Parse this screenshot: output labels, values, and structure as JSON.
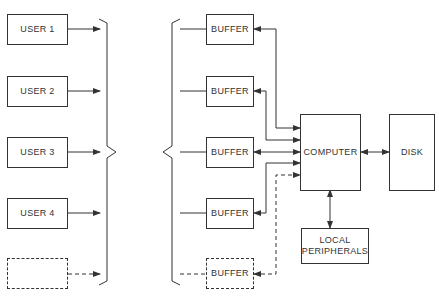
{
  "diagram": {
    "users": [
      {
        "label": "USER 1",
        "dashed": false
      },
      {
        "label": "USER 2",
        "dashed": false
      },
      {
        "label": "USER 3",
        "dashed": false
      },
      {
        "label": "USER 4",
        "dashed": false
      },
      {
        "label": "",
        "dashed": true
      }
    ],
    "buffers": [
      {
        "label": "BUFFER",
        "dashed": false
      },
      {
        "label": "BUFFER",
        "dashed": false
      },
      {
        "label": "BUFFER",
        "dashed": false
      },
      {
        "label": "BUFFER",
        "dashed": false
      },
      {
        "label": "BUFFER",
        "dashed": true
      }
    ],
    "computer": {
      "label": "COMPUTER"
    },
    "disk": {
      "label": "DISK"
    },
    "local_peripherals": {
      "label": "LOCAL PERIPHERALS"
    },
    "line_color": "#333333"
  }
}
